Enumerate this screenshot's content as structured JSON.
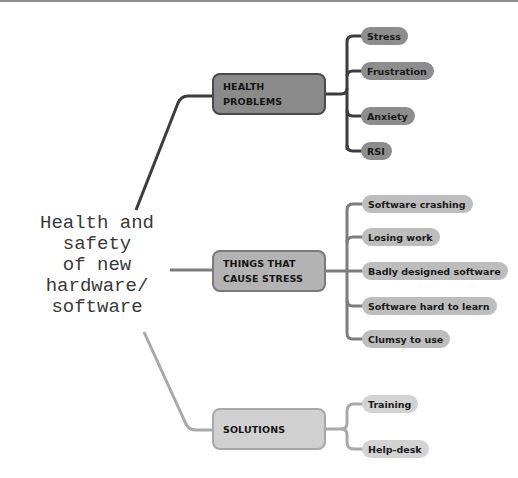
{
  "central_topic": {
    "lines": [
      "Health and",
      "safety",
      "of new",
      "hardware/",
      "software"
    ]
  },
  "branches": [
    {
      "label_lines": [
        "HEALTH PROBLEMS"
      ],
      "color": "#8a8a8a",
      "leaves": [
        "Stress",
        "Frustration",
        "Anxiety",
        "RSI"
      ]
    },
    {
      "label_lines": [
        "THINGS THAT",
        "CAUSE STRESS"
      ],
      "color": "#b3b3b3",
      "leaves": [
        "Software crashing",
        "Losing work",
        "Badly designed software",
        "Software hard to learn",
        "Clumsy to use"
      ]
    },
    {
      "label_lines": [
        "SOLUTIONS"
      ],
      "color": "#d0d0d0",
      "leaves": [
        "Training",
        "Help-desk"
      ]
    }
  ]
}
